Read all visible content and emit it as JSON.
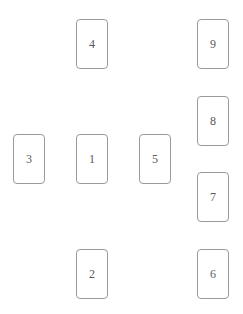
{
  "canvas": {
    "width": 243,
    "height": 314,
    "background": "#ffffff"
  },
  "style": {
    "card_border_color": "#9a9a9a",
    "card_fill_color": "#ffffff",
    "card_label_color": "#5a5a5a",
    "card_width": 32,
    "card_height": 50,
    "card_corner_radius": 4
  },
  "spread": {
    "name": "card-spread-layout",
    "card_count": 9,
    "cards": [
      {
        "label": "4",
        "x": 76,
        "y": 19,
        "w": 32,
        "h": 50,
        "position": "top-center"
      },
      {
        "label": "9",
        "x": 197,
        "y": 19,
        "w": 32,
        "h": 50,
        "position": "right-column-1"
      },
      {
        "label": "8",
        "x": 197,
        "y": 96,
        "w": 32,
        "h": 50,
        "position": "right-column-2"
      },
      {
        "label": "3",
        "x": 13,
        "y": 134,
        "w": 32,
        "h": 50,
        "position": "middle-left"
      },
      {
        "label": "1",
        "x": 76,
        "y": 134,
        "w": 32,
        "h": 50,
        "position": "middle-center"
      },
      {
        "label": "5",
        "x": 139,
        "y": 134,
        "w": 32,
        "h": 50,
        "position": "middle-right"
      },
      {
        "label": "7",
        "x": 197,
        "y": 172,
        "w": 32,
        "h": 50,
        "position": "right-column-3"
      },
      {
        "label": "2",
        "x": 76,
        "y": 249,
        "w": 32,
        "h": 50,
        "position": "bottom-center"
      },
      {
        "label": "6",
        "x": 197,
        "y": 249,
        "w": 32,
        "h": 50,
        "position": "right-column-4"
      }
    ]
  }
}
